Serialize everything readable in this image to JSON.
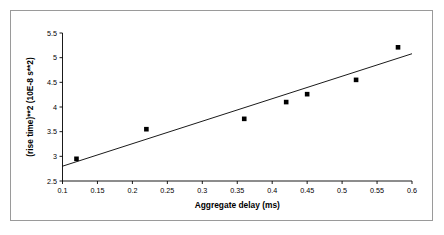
{
  "chart_data": {
    "type": "scatter",
    "title": "",
    "xlabel": "Aggregate delay (ms)",
    "ylabel": "(rise time)**2 (10E-8 s**2)",
    "xlim": [
      0.1,
      0.6
    ],
    "ylim": [
      2.5,
      5.5
    ],
    "xticks": [
      0.1,
      0.15,
      0.2,
      0.25,
      0.3,
      0.35,
      0.4,
      0.45,
      0.5,
      0.55,
      0.6
    ],
    "xtick_labels": [
      "0.1",
      "0.15",
      "0.2",
      "0.25",
      "0.3",
      "0.35",
      "0.4",
      "0.45",
      "0.5",
      "0.55",
      "0.6"
    ],
    "yticks": [
      2.5,
      3,
      3.5,
      4,
      4.5,
      5,
      5.5
    ],
    "ytick_labels": [
      "2.5",
      "3",
      "3.5",
      "4",
      "4.5",
      "5",
      "5.5"
    ],
    "grid": false,
    "legend": false,
    "marker": "square",
    "marker_color": "#000000",
    "trendline_color": "#000000",
    "series": [
      {
        "name": "data",
        "points": [
          {
            "x": 0.12,
            "y": 2.95
          },
          {
            "x": 0.22,
            "y": 3.55
          },
          {
            "x": 0.36,
            "y": 3.76
          },
          {
            "x": 0.42,
            "y": 4.1
          },
          {
            "x": 0.45,
            "y": 4.26
          },
          {
            "x": 0.52,
            "y": 4.55
          },
          {
            "x": 0.58,
            "y": 5.21
          }
        ]
      }
    ],
    "trendline": {
      "name": "linear fit",
      "x1": 0.1,
      "y1": 2.8,
      "x2": 0.6,
      "y2": 5.08
    }
  },
  "figure": {
    "border_color": "#9a9a9a",
    "background": "#ffffff",
    "axis_color": "#000000"
  }
}
